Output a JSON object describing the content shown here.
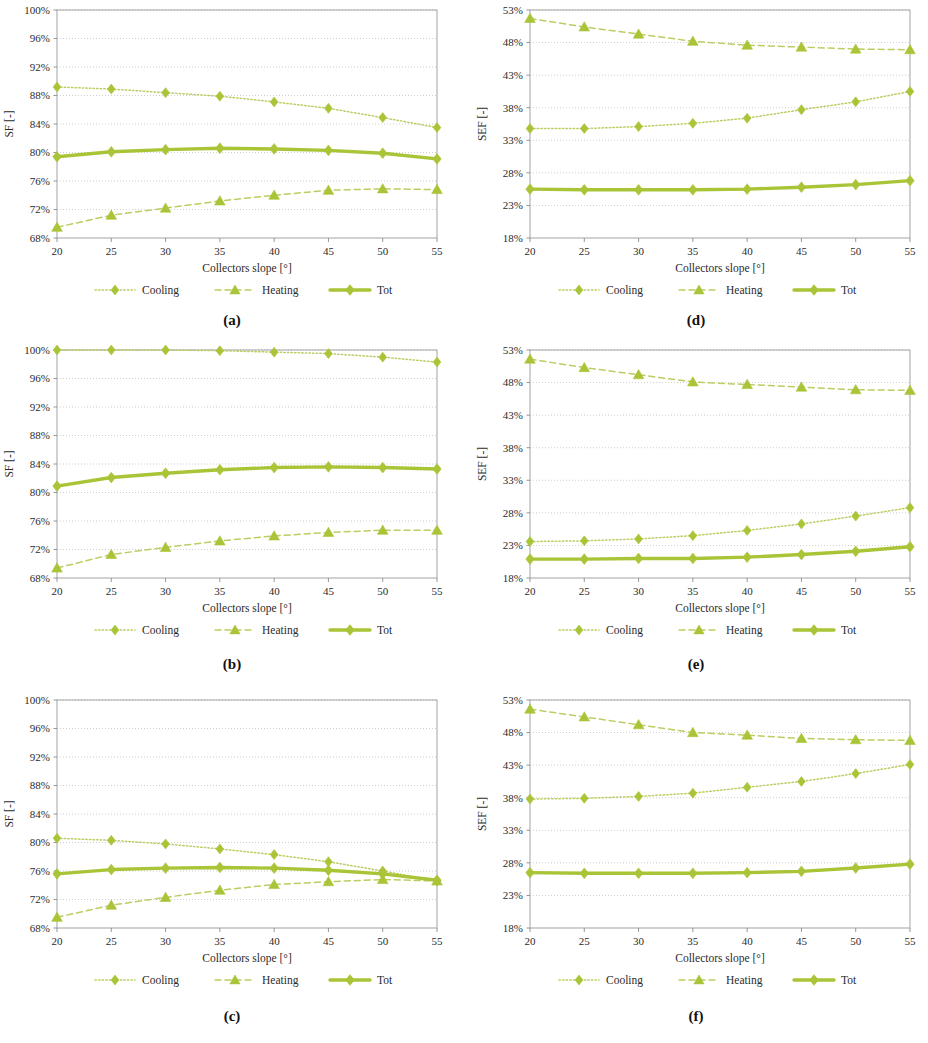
{
  "figure": {
    "series_names": {
      "cooling": "Cooling",
      "heating": "Heating",
      "tot": "Tot"
    },
    "colors": {
      "series_green": "#A9C437",
      "series_green_light": "#BCCD63",
      "grid": "#BFBFBF",
      "axis": "#808080",
      "text": "#2b2b2b"
    },
    "xlabel": "Collectors slope [°]",
    "ylabel_sf": "SF [-]",
    "ylabel_sef": "SEF [-]",
    "x_ticks": [
      "20",
      "25",
      "30",
      "35",
      "40",
      "45",
      "50",
      "55"
    ],
    "sf_ticks": [
      "68%",
      "72%",
      "76%",
      "80%",
      "84%",
      "88%",
      "92%",
      "96%",
      "100%"
    ],
    "sef_ticks": [
      "18%",
      "23%",
      "28%",
      "33%",
      "38%",
      "43%",
      "48%",
      "53%"
    ],
    "captions": {
      "a": "(a)",
      "b": "(b)",
      "c": "(c)",
      "d": "(d)",
      "e": "(e)",
      "f": "(f)"
    }
  },
  "chart_data": [
    {
      "id": "a",
      "label": "(a)",
      "type": "line",
      "title": "",
      "xlabel": "Collectors slope [°]",
      "ylabel": "SF [-]",
      "x": [
        20,
        25,
        30,
        35,
        40,
        45,
        50,
        55
      ],
      "xlim": [
        20,
        55
      ],
      "ylim": [
        68,
        100
      ],
      "ytickstep": 4,
      "yunit": "%",
      "grid": true,
      "legend_position": "below",
      "series": [
        {
          "name": "Cooling",
          "style": "dotted",
          "marker": "diamond",
          "values": [
            89.2,
            88.9,
            88.4,
            87.9,
            87.1,
            86.2,
            84.9,
            83.5
          ]
        },
        {
          "name": "Heating",
          "style": "dashed",
          "marker": "triangle",
          "values": [
            69.5,
            71.2,
            72.2,
            73.2,
            74.0,
            74.7,
            74.9,
            74.8
          ]
        },
        {
          "name": "Tot",
          "style": "solid",
          "marker": "diamond",
          "values": [
            79.4,
            80.1,
            80.4,
            80.6,
            80.5,
            80.3,
            79.9,
            79.1
          ]
        }
      ]
    },
    {
      "id": "b",
      "label": "(b)",
      "type": "line",
      "title": "",
      "xlabel": "Collectors slope [°]",
      "ylabel": "SF [-]",
      "x": [
        20,
        25,
        30,
        35,
        40,
        45,
        50,
        55
      ],
      "xlim": [
        20,
        55
      ],
      "ylim": [
        68,
        100
      ],
      "ytickstep": 4,
      "yunit": "%",
      "grid": true,
      "legend_position": "below",
      "series": [
        {
          "name": "Cooling",
          "style": "dotted",
          "marker": "diamond",
          "values": [
            100.0,
            100.0,
            100.0,
            99.9,
            99.7,
            99.5,
            99.0,
            98.3
          ]
        },
        {
          "name": "Heating",
          "style": "dashed",
          "marker": "triangle",
          "values": [
            69.4,
            71.3,
            72.3,
            73.2,
            73.9,
            74.4,
            74.7,
            74.7
          ]
        },
        {
          "name": "Tot",
          "style": "solid",
          "marker": "diamond",
          "values": [
            80.9,
            82.1,
            82.7,
            83.2,
            83.5,
            83.6,
            83.5,
            83.3
          ]
        }
      ]
    },
    {
      "id": "c",
      "label": "(c)",
      "type": "line",
      "title": "",
      "xlabel": "Collectors slope [°]",
      "ylabel": "SF [-]",
      "x": [
        20,
        25,
        30,
        35,
        40,
        45,
        50,
        55
      ],
      "xlim": [
        20,
        55
      ],
      "ylim": [
        68,
        100
      ],
      "ytickstep": 4,
      "yunit": "%",
      "grid": true,
      "legend_position": "below",
      "series": [
        {
          "name": "Cooling",
          "style": "dotted",
          "marker": "diamond",
          "values": [
            80.6,
            80.3,
            79.8,
            79.1,
            78.3,
            77.3,
            76.0,
            74.6
          ]
        },
        {
          "name": "Heating",
          "style": "dashed",
          "marker": "triangle",
          "values": [
            69.5,
            71.2,
            72.3,
            73.3,
            74.1,
            74.5,
            74.8,
            74.6
          ]
        },
        {
          "name": "Tot",
          "style": "solid",
          "marker": "diamond",
          "values": [
            75.6,
            76.2,
            76.4,
            76.5,
            76.4,
            76.1,
            75.6,
            74.7
          ]
        }
      ]
    },
    {
      "id": "d",
      "label": "(d)",
      "type": "line",
      "title": "",
      "xlabel": "Collectors slope [°]",
      "ylabel": "SEF [-]",
      "x": [
        20,
        25,
        30,
        35,
        40,
        45,
        50,
        55
      ],
      "xlim": [
        20,
        55
      ],
      "ylim": [
        18,
        53
      ],
      "ytickstep": 5,
      "yunit": "%",
      "grid": true,
      "legend_position": "below",
      "series": [
        {
          "name": "Cooling",
          "style": "dotted",
          "marker": "diamond",
          "values": [
            34.8,
            34.8,
            35.1,
            35.6,
            36.4,
            37.7,
            38.9,
            40.5
          ]
        },
        {
          "name": "Heating",
          "style": "dashed",
          "marker": "triangle",
          "values": [
            51.7,
            50.4,
            49.3,
            48.2,
            47.6,
            47.3,
            47.0,
            46.9
          ]
        },
        {
          "name": "Tot",
          "style": "solid",
          "marker": "diamond",
          "values": [
            25.5,
            25.4,
            25.4,
            25.4,
            25.5,
            25.8,
            26.2,
            26.8
          ]
        }
      ]
    },
    {
      "id": "e",
      "label": "(e)",
      "type": "line",
      "title": "",
      "xlabel": "Collectors slope [°]",
      "ylabel": "SEF [-]",
      "x": [
        20,
        25,
        30,
        35,
        40,
        45,
        50,
        55
      ],
      "xlim": [
        20,
        55
      ],
      "ylim": [
        18,
        53
      ],
      "ytickstep": 5,
      "yunit": "%",
      "grid": true,
      "legend_position": "below",
      "series": [
        {
          "name": "Cooling",
          "style": "dotted",
          "marker": "diamond",
          "values": [
            23.6,
            23.7,
            24.0,
            24.5,
            25.3,
            26.3,
            27.5,
            28.8
          ]
        },
        {
          "name": "Heating",
          "style": "dashed",
          "marker": "triangle",
          "values": [
            51.6,
            50.3,
            49.2,
            48.1,
            47.7,
            47.3,
            46.9,
            46.8
          ]
        },
        {
          "name": "Tot",
          "style": "solid",
          "marker": "diamond",
          "values": [
            20.9,
            20.9,
            21.0,
            21.0,
            21.2,
            21.6,
            22.1,
            22.8
          ]
        }
      ]
    },
    {
      "id": "f",
      "label": "(f)",
      "type": "line",
      "title": "",
      "xlabel": "Collectors slope [°]",
      "ylabel": "SEF [-]",
      "x": [
        20,
        25,
        30,
        35,
        40,
        45,
        50,
        55
      ],
      "xlim": [
        18,
        53
      ],
      "ylim": [
        18,
        53
      ],
      "ytickstep": 5,
      "yunit": "%",
      "grid": true,
      "legend_position": "below",
      "series": [
        {
          "name": "Cooling",
          "style": "dotted",
          "marker": "diamond",
          "values": [
            37.8,
            37.9,
            38.2,
            38.7,
            39.6,
            40.5,
            41.7,
            43.1
          ]
        },
        {
          "name": "Heating",
          "style": "dashed",
          "marker": "triangle",
          "values": [
            51.6,
            50.4,
            49.2,
            48.0,
            47.6,
            47.1,
            46.9,
            46.8
          ]
        },
        {
          "name": "Tot",
          "style": "solid",
          "marker": "diamond",
          "values": [
            26.5,
            26.4,
            26.4,
            26.4,
            26.5,
            26.7,
            27.2,
            27.8
          ]
        }
      ]
    }
  ]
}
